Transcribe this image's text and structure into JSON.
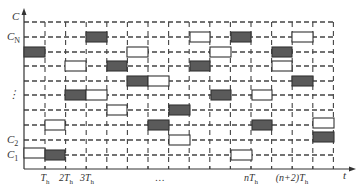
{
  "diagram": {
    "type": "timing-grid",
    "colors": {
      "filled": "#5a5a5a",
      "hollow": "#ffffff",
      "border": "#333333",
      "grid": "#444444"
    },
    "axes": {
      "y_label": "C",
      "x_label": "t",
      "origin_x": 24,
      "axis_y": 169,
      "x_end": 352,
      "y_top": 10
    },
    "grid": {
      "columns_x": [
        45,
        65.6,
        86.2,
        106.8,
        127.4,
        148,
        168.6,
        189.2,
        209.8,
        230.4,
        251,
        271.6,
        292.2,
        312.8,
        333.4
      ],
      "rows_y": [
        22,
        37,
        52,
        66,
        81,
        95,
        110,
        125,
        140,
        155
      ],
      "x_right": 335
    },
    "row_labels": [
      {
        "text": "C",
        "sub": "N",
        "y": 37
      },
      {
        "text": "⋮",
        "sub": "",
        "y": 95
      },
      {
        "text": "C",
        "sub": "2",
        "y": 140
      },
      {
        "text": "C",
        "sub": "1",
        "y": 155
      }
    ],
    "tick_labels": [
      {
        "pre": "",
        "var": "T",
        "sub": "h",
        "x": 45
      },
      {
        "pre": "2",
        "var": "T",
        "sub": "h",
        "x": 66
      },
      {
        "pre": "3",
        "var": "T",
        "sub": "h",
        "x": 87
      },
      {
        "pre": "…",
        "var": "",
        "sub": "",
        "x": 160
      },
      {
        "pre": "n",
        "var": "T",
        "sub": "h",
        "x": 251
      },
      {
        "pre": "(n+2)",
        "var": "T",
        "sub": "h",
        "x": 292
      }
    ],
    "blocks": [
      {
        "x1": 86,
        "x2": 107,
        "row": 1,
        "fill": "filled"
      },
      {
        "x1": 190,
        "x2": 210,
        "row": 1,
        "fill": "hollow"
      },
      {
        "x1": 231,
        "x2": 251,
        "row": 1,
        "fill": "filled"
      },
      {
        "x1": 292,
        "x2": 313,
        "row": 1,
        "fill": "hollow"
      },
      {
        "x1": 24,
        "x2": 45,
        "row": 2,
        "fill": "filled"
      },
      {
        "x1": 127,
        "x2": 148,
        "row": 2,
        "fill": "hollow"
      },
      {
        "x1": 210,
        "x2": 231,
        "row": 2,
        "fill": "hollow"
      },
      {
        "x1": 272,
        "x2": 292,
        "row": 2,
        "fill": "filled"
      },
      {
        "x1": 65,
        "x2": 86,
        "row": 3,
        "fill": "hollow"
      },
      {
        "x1": 107,
        "x2": 127,
        "row": 3,
        "fill": "filled"
      },
      {
        "x1": 190,
        "x2": 210,
        "row": 3,
        "fill": "filled"
      },
      {
        "x1": 272,
        "x2": 292,
        "row": 3,
        "fill": "hollow"
      },
      {
        "x1": 127,
        "x2": 148,
        "row": 4,
        "fill": "filled"
      },
      {
        "x1": 148,
        "x2": 169,
        "row": 4,
        "fill": "hollow"
      },
      {
        "x1": 292,
        "x2": 313,
        "row": 4,
        "fill": "filled"
      },
      {
        "x1": 65,
        "x2": 86,
        "row": 5,
        "fill": "filled"
      },
      {
        "x1": 86,
        "x2": 107,
        "row": 5,
        "fill": "hollow"
      },
      {
        "x1": 211,
        "x2": 231,
        "row": 5,
        "fill": "filled"
      },
      {
        "x1": 252,
        "x2": 272,
        "row": 5,
        "fill": "hollow"
      },
      {
        "x1": 107,
        "x2": 127,
        "row": 6,
        "fill": "hollow"
      },
      {
        "x1": 169,
        "x2": 190,
        "row": 6,
        "fill": "filled"
      },
      {
        "x1": 45,
        "x2": 65,
        "row": 7,
        "fill": "hollow"
      },
      {
        "x1": 148,
        "x2": 169,
        "row": 7,
        "fill": "filled"
      },
      {
        "x1": 252,
        "x2": 272,
        "row": 7,
        "fill": "filled"
      },
      {
        "x1": 313,
        "x2": 334,
        "row": 7,
        "fill": "hollow",
        "dy": -2
      },
      {
        "x1": 169,
        "x2": 190,
        "row": 8,
        "fill": "hollow"
      },
      {
        "x1": 313,
        "x2": 334,
        "row": 8,
        "fill": "filled",
        "dy": -3
      },
      {
        "x1": 24,
        "x2": 45,
        "row": 9,
        "fill": "hollow",
        "dy": -2
      },
      {
        "x1": 45,
        "x2": 65,
        "row": 9,
        "fill": "filled"
      },
      {
        "x1": 231,
        "x2": 252,
        "row": 9,
        "fill": "hollow"
      }
    ]
  }
}
